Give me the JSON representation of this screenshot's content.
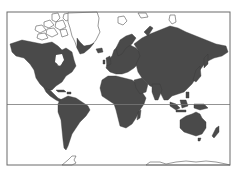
{
  "map": {
    "title": "World Map",
    "projection": "Mercator",
    "colors": {
      "background": "#ffffff",
      "land": "#4a4a4a",
      "outline": "#555555",
      "frame": "#6a6a6a",
      "equator": "#777777"
    },
    "frame": {
      "x": 7,
      "y": 12,
      "width": 223,
      "height": 153
    },
    "equator_y": 104.5,
    "regions": [
      "North America",
      "South America",
      "Greenland",
      "Europe",
      "Africa",
      "Asia",
      "Australia",
      "Antarctica"
    ]
  }
}
